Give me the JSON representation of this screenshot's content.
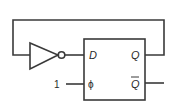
{
  "diagram": {
    "type": "circuit",
    "title": "",
    "components": {
      "inverter": {
        "label": ""
      },
      "flipflop": {
        "inputs": {
          "d": "D",
          "clock": "ϕ"
        },
        "outputs": {
          "q": "Q",
          "qbar": "Q"
        }
      }
    },
    "clock_input_value": "1",
    "colors": {
      "line": "#3a3a3a",
      "text": "#2a2a2a",
      "background": "#ffffff"
    }
  }
}
